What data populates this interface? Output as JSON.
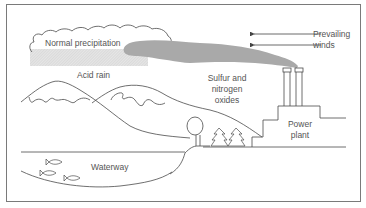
{
  "diagram": {
    "type": "illustration",
    "labels": {
      "normal_precipitation": "Normal precipitation",
      "acid_rain": "Acid rain",
      "prevailing_winds_line1": "Prevailing",
      "prevailing_winds_line2": "winds",
      "sulfur_line1": "Sulfur and",
      "sulfur_line2": "nitrogen",
      "sulfur_line3": "oxides",
      "power_plant_line1": "Power",
      "power_plant_line2": "plant",
      "waterway": "Waterway"
    },
    "elements": [
      {
        "id": "cloud",
        "name": "Normal precipitation cloud"
      },
      {
        "id": "rain-band",
        "name": "Acid rain hatched band"
      },
      {
        "id": "plume",
        "name": "Sulfur and nitrogen oxides smoke plume"
      },
      {
        "id": "wind-arrows",
        "name": "Prevailing winds arrows",
        "count": 2,
        "direction": "left"
      },
      {
        "id": "smokestacks",
        "name": "Power plant smokestacks",
        "count": 2
      },
      {
        "id": "power-plant",
        "name": "Power plant building"
      },
      {
        "id": "mountains",
        "name": "Snow-capped mountains",
        "count": 2
      },
      {
        "id": "tree",
        "name": "Deciduous tree"
      },
      {
        "id": "pines",
        "name": "Pine trees",
        "count": 2
      },
      {
        "id": "waterway",
        "name": "Waterway / lake"
      },
      {
        "id": "fish",
        "name": "Fish",
        "count": 3
      }
    ],
    "colors": {
      "line": "#4a4a4a",
      "plume": "#a9a9a9",
      "rain_hatch": "#d6d6d6",
      "text": "#555555",
      "background": "#ffffff"
    }
  }
}
